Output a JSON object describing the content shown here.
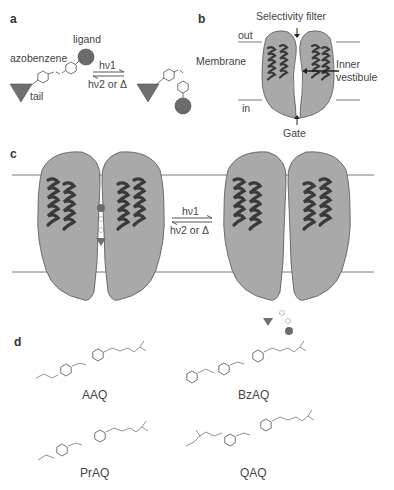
{
  "panels": {
    "a": {
      "label": "a",
      "ligand": "ligand",
      "azobenzene": "azobenzene",
      "tail": "tail",
      "forward": "hν1",
      "reverse": "hν2 or Δ"
    },
    "b": {
      "label": "b",
      "selectivity_filter": "Selectivity filter",
      "out": "out",
      "membrane": "Membrane",
      "inner": "Inner",
      "vestibule": "vestibule",
      "in": "in",
      "gate": "Gate"
    },
    "c": {
      "label": "c",
      "forward": "hν1",
      "reverse": "hν2 or Δ"
    },
    "d": {
      "label": "d",
      "compounds": [
        "AAQ",
        "BzAQ",
        "PrAQ",
        "QAQ"
      ]
    }
  },
  "colors": {
    "protein_fill": "#a9a9a9",
    "helix": "#3a3a3a",
    "ligand_ball": "#6b6b6b",
    "tail_triangle": "#707070",
    "line": "#555555"
  }
}
